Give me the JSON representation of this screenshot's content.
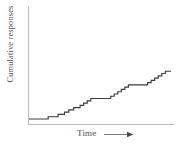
{
  "chart_data": {
    "type": "line",
    "subtype": "cumulative-record-step-function",
    "title": "",
    "xlabel": "Time",
    "ylabel": "Cumulative responses",
    "xlabel_arrow": "right-arrow",
    "grid": false,
    "legend": null,
    "axis_ticks": {
      "x": [],
      "y": []
    },
    "xlim": [
      0,
      100
    ],
    "ylim": [
      0,
      100
    ],
    "axes_visible": {
      "x_axis": true,
      "y_axis": true,
      "top_spine": false,
      "right_spine": false
    },
    "series": [
      {
        "name": "Cumulative responses",
        "color": "#3a3a3a",
        "step_mode": "post",
        "x": [
          0.0,
          13.5,
          13.5,
          20.5,
          20.5,
          25.0,
          25.0,
          28.0,
          28.0,
          31.5,
          31.5,
          36.0,
          36.0,
          38.5,
          38.5,
          41.0,
          41.0,
          43.5,
          43.5,
          57.5,
          57.5,
          60.0,
          60.0,
          62.5,
          62.5,
          65.0,
          65.0,
          67.5,
          67.5,
          70.0,
          70.0,
          83.5,
          83.5,
          86.0,
          86.0,
          88.5,
          88.5,
          91.0,
          91.0,
          93.5,
          93.5,
          96.0,
          96.0,
          100.0
        ],
        "y": [
          4.0,
          4.0,
          8.5,
          8.5,
          13.0,
          13.0,
          17.5,
          17.5,
          22.0,
          22.0,
          26.5,
          26.5,
          31.0,
          31.0,
          35.5,
          35.5,
          40.0,
          40.0,
          44.5,
          44.5,
          49.0,
          49.0,
          53.5,
          53.5,
          58.0,
          58.0,
          62.5,
          62.5,
          67.0,
          67.0,
          71.5,
          71.5,
          76.0,
          76.0,
          80.5,
          80.5,
          85.0,
          85.0,
          89.5,
          89.5,
          94.0,
          94.0,
          98.5,
          98.5
        ]
      }
    ],
    "annotations": [
      {
        "text": "flat initial pause",
        "x_range": [
          0,
          13.5
        ]
      },
      {
        "text": "middle plateau",
        "x_range": [
          43.5,
          57.5
        ]
      },
      {
        "text": "final plateau",
        "x_range": [
          96.0,
          100.0
        ]
      }
    ]
  },
  "labels": {
    "y_axis": "Cumulative responses",
    "x_axis": "Time"
  },
  "colors": {
    "curve": "#3a3a3a",
    "axis": "#b9b9b9",
    "text": "#4a4a4a",
    "background": "#ffffff"
  }
}
